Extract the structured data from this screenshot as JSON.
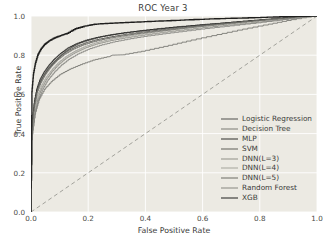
{
  "chart_data": {
    "type": "line",
    "title": "ROC Year 3",
    "xlabel": "False Positive Rate",
    "ylabel": "True Positive Rate",
    "xlim": [
      0.0,
      1.0
    ],
    "ylim": [
      0.0,
      1.0
    ],
    "xticks": [
      "0.0",
      "0.2",
      "0.4",
      "0.6",
      "0.8",
      "1.0"
    ],
    "yticks": [
      "0.0",
      "0.2",
      "0.4",
      "0.6",
      "0.8",
      "1.0"
    ],
    "grid": true,
    "legend_position": "lower right",
    "background_color": "#eceae3",
    "gridline_color": "#ffffff",
    "chance_line": {
      "name": "chance-diagonal",
      "style": "dashed",
      "color": "#9a9a93",
      "x": [
        0.0,
        1.0
      ],
      "y": [
        0.0,
        1.0
      ]
    },
    "series": [
      {
        "name": "Logistic Regression",
        "color": "#4f4f4c",
        "width": 0.9,
        "x": [
          0.0,
          0.004,
          0.01,
          0.016,
          0.024,
          0.034,
          0.046,
          0.06,
          0.078,
          0.098,
          0.12,
          0.145,
          0.175,
          0.21,
          0.25,
          0.3,
          0.36,
          0.43,
          0.5,
          0.58,
          0.67,
          0.76,
          0.85,
          0.93,
          1.0
        ],
        "y": [
          0.0,
          0.42,
          0.52,
          0.585,
          0.63,
          0.665,
          0.695,
          0.725,
          0.755,
          0.785,
          0.815,
          0.84,
          0.862,
          0.878,
          0.893,
          0.906,
          0.918,
          0.929,
          0.94,
          0.951,
          0.962,
          0.973,
          0.983,
          0.992,
          1.0
        ]
      },
      {
        "name": "Decision Tree",
        "color": "#7b7b75",
        "width": 0.9,
        "x": [
          0.0,
          0.006,
          0.016,
          0.03,
          0.05,
          0.075,
          0.105,
          0.14,
          0.18,
          0.225,
          0.275,
          0.285,
          0.33,
          0.4,
          0.48,
          0.56,
          0.65,
          0.74,
          0.83,
          0.91,
          1.0
        ],
        "y": [
          0.0,
          0.4,
          0.5,
          0.57,
          0.625,
          0.665,
          0.7,
          0.728,
          0.752,
          0.775,
          0.792,
          0.8,
          0.802,
          0.82,
          0.845,
          0.872,
          0.9,
          0.928,
          0.954,
          0.977,
          1.0
        ]
      },
      {
        "name": "MLP",
        "color": "#2f2f2d",
        "width": 1.0,
        "x": [
          0.0,
          0.005,
          0.012,
          0.021,
          0.032,
          0.046,
          0.063,
          0.083,
          0.106,
          0.132,
          0.162,
          0.196,
          0.234,
          0.277,
          0.325,
          0.38,
          0.44,
          0.51,
          0.59,
          0.68,
          0.78,
          0.88,
          1.0
        ],
        "y": [
          0.0,
          0.44,
          0.555,
          0.625,
          0.672,
          0.71,
          0.745,
          0.778,
          0.808,
          0.836,
          0.858,
          0.876,
          0.89,
          0.902,
          0.913,
          0.923,
          0.933,
          0.943,
          0.953,
          0.964,
          0.976,
          0.988,
          1.0
        ]
      },
      {
        "name": "SVM",
        "color": "#5e5e59",
        "width": 0.9,
        "x": [
          0.0,
          0.004,
          0.011,
          0.02,
          0.031,
          0.045,
          0.062,
          0.082,
          0.105,
          0.132,
          0.163,
          0.198,
          0.238,
          0.283,
          0.333,
          0.39,
          0.455,
          0.53,
          0.61,
          0.7,
          0.79,
          0.89,
          1.0
        ],
        "y": [
          0.0,
          0.425,
          0.535,
          0.605,
          0.655,
          0.695,
          0.732,
          0.765,
          0.795,
          0.822,
          0.845,
          0.864,
          0.88,
          0.893,
          0.905,
          0.917,
          0.928,
          0.94,
          0.952,
          0.964,
          0.976,
          0.988,
          1.0
        ]
      },
      {
        "name": "DNN(L=3)",
        "color": "#8f8f88",
        "width": 0.9,
        "x": [
          0.0,
          0.006,
          0.014,
          0.025,
          0.039,
          0.056,
          0.076,
          0.1,
          0.127,
          0.158,
          0.193,
          0.233,
          0.278,
          0.328,
          0.385,
          0.45,
          0.52,
          0.6,
          0.69,
          0.79,
          0.89,
          1.0
        ],
        "y": [
          0.0,
          0.4,
          0.5,
          0.575,
          0.63,
          0.675,
          0.715,
          0.752,
          0.785,
          0.812,
          0.836,
          0.856,
          0.872,
          0.886,
          0.899,
          0.912,
          0.925,
          0.938,
          0.952,
          0.966,
          0.982,
          1.0
        ]
      },
      {
        "name": "DNN(L=4)",
        "color": "#a3a39c",
        "width": 0.9,
        "x": [
          0.0,
          0.005,
          0.013,
          0.024,
          0.038,
          0.055,
          0.075,
          0.098,
          0.125,
          0.156,
          0.19,
          0.23,
          0.275,
          0.325,
          0.38,
          0.445,
          0.515,
          0.595,
          0.685,
          0.785,
          0.89,
          1.0
        ],
        "y": [
          0.0,
          0.415,
          0.515,
          0.59,
          0.642,
          0.686,
          0.724,
          0.76,
          0.792,
          0.819,
          0.842,
          0.862,
          0.878,
          0.892,
          0.905,
          0.918,
          0.931,
          0.944,
          0.957,
          0.971,
          0.986,
          1.0
        ]
      },
      {
        "name": "DNN(L=5)",
        "color": "#6b6b65",
        "width": 0.9,
        "x": [
          0.0,
          0.005,
          0.013,
          0.023,
          0.036,
          0.052,
          0.071,
          0.093,
          0.119,
          0.149,
          0.183,
          0.222,
          0.266,
          0.315,
          0.37,
          0.435,
          0.505,
          0.585,
          0.675,
          0.775,
          0.885,
          1.0
        ],
        "y": [
          0.0,
          0.43,
          0.535,
          0.608,
          0.658,
          0.7,
          0.738,
          0.772,
          0.802,
          0.828,
          0.85,
          0.868,
          0.883,
          0.896,
          0.908,
          0.92,
          0.932,
          0.945,
          0.958,
          0.972,
          0.987,
          1.0
        ]
      },
      {
        "name": "Random Forest",
        "color": "#858580",
        "width": 0.9,
        "x": [
          0.0,
          0.006,
          0.015,
          0.027,
          0.042,
          0.06,
          0.082,
          0.107,
          0.136,
          0.169,
          0.206,
          0.248,
          0.295,
          0.348,
          0.407,
          0.473,
          0.545,
          0.625,
          0.712,
          0.805,
          0.9,
          1.0
        ],
        "y": [
          0.0,
          0.395,
          0.495,
          0.568,
          0.622,
          0.668,
          0.708,
          0.745,
          0.778,
          0.806,
          0.83,
          0.85,
          0.867,
          0.882,
          0.896,
          0.909,
          0.922,
          0.936,
          0.95,
          0.965,
          0.982,
          1.0
        ]
      },
      {
        "name": "XGB",
        "color": "#1f1f1e",
        "width": 1.35,
        "x": [
          0.0,
          0.004,
          0.009,
          0.016,
          0.025,
          0.036,
          0.05,
          0.066,
          0.085,
          0.107,
          0.132,
          0.16,
          0.192,
          0.228,
          0.268,
          0.312,
          0.36,
          0.42,
          0.49,
          0.57,
          0.66,
          0.76,
          0.87,
          1.0
        ],
        "y": [
          0.0,
          0.615,
          0.7,
          0.755,
          0.8,
          0.83,
          0.855,
          0.873,
          0.888,
          0.9,
          0.912,
          0.935,
          0.948,
          0.958,
          0.962,
          0.965,
          0.968,
          0.972,
          0.976,
          0.981,
          0.986,
          0.99,
          0.995,
          1.0
        ]
      }
    ]
  }
}
